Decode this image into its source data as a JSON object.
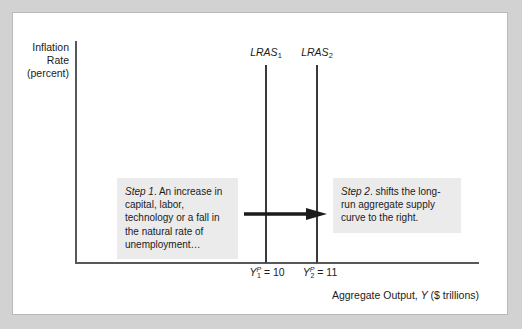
{
  "figure": {
    "y_axis_title_lines": [
      "Inflation",
      "Rate",
      "(percent)"
    ],
    "x_axis_title_prefix": "Aggregate Output, ",
    "x_axis_title_variable": "Y",
    "x_axis_title_suffix": " ($ trillions)"
  },
  "curves": [
    {
      "name": "lras1",
      "label_base": "LRAS",
      "label_subscript": "1",
      "position_x": 253
    },
    {
      "name": "lras2",
      "label_base": "LRAS",
      "label_subscript": "2",
      "position_x": 304
    }
  ],
  "output_labels": [
    {
      "name": "output1",
      "variable": "Y",
      "superscript": "P",
      "subscript": "1",
      "equals": " = ",
      "value": "10"
    },
    {
      "name": "output2",
      "variable": "Y",
      "superscript": "P",
      "subscript": "2",
      "equals": " = ",
      "value": "11"
    }
  ],
  "callouts": [
    {
      "name": "step1",
      "tag": "Step 1",
      "text": ". An increase in capital, labor, technology or a fall in the natural rate of unemployment…"
    },
    {
      "name": "step2",
      "tag": "Step 2",
      "text": ". shifts the long-run aggregate supply curve to the right."
    }
  ],
  "colors": {
    "background": "#d2d2d2",
    "panel": "#ffffff",
    "axis": "#58585a",
    "curve": "#3a3a3c",
    "callout_fill": "#ebebeb",
    "arrow": "#1b1b1b",
    "text": "#1b1b1b"
  }
}
